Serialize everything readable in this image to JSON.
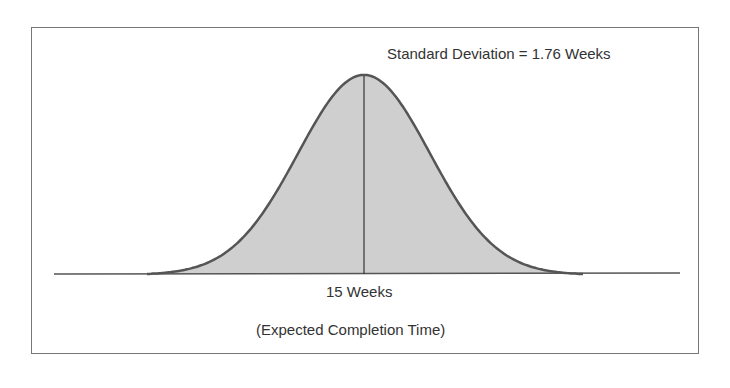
{
  "chart_data": {
    "type": "area",
    "title": "",
    "distribution": "normal",
    "mean_label": "15 Weeks",
    "mean": 15,
    "std_dev": 1.76,
    "annotation": "Standard Deviation = 1.76 Weeks",
    "xlabel": "(Expected Completion Time)",
    "ylabel": "",
    "grid": false,
    "legend": null,
    "colors": {
      "fill": "#cfcfcf",
      "curve": "#555555",
      "axis": "#555555",
      "frame": "#777777"
    }
  },
  "labels": {
    "std_dev": "Standard Deviation = 1.76 Weeks",
    "mean": "15 Weeks",
    "caption": "(Expected Completion Time)"
  }
}
